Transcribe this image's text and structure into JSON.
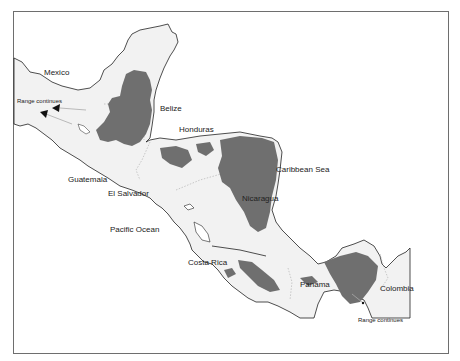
{
  "map": {
    "title": "",
    "colors": {
      "land": "#f2f2f2",
      "range": "#6f6f6f",
      "coast": "#222222",
      "border": "#aaaaaa",
      "frame": "#6e6e6e"
    },
    "labels": {
      "mexico": "Mexico",
      "belize": "Belize",
      "honduras": "Honduras",
      "guatemala": "Guatemala",
      "el_salvador": "El Salvador",
      "nicaragua": "Nicaragua",
      "caribbean_sea": "Caribbean Sea",
      "pacific_ocean": "Pacific Ocean",
      "costa_rica": "Costa Rica",
      "panama": "Panama",
      "colombia": "Colombia",
      "range_continues_west": "Range continues",
      "range_continues_south": "Range continues"
    }
  }
}
